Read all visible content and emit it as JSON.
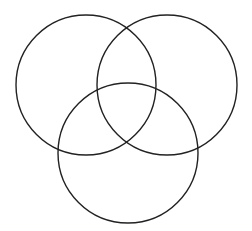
{
  "diagram": {
    "type": "venn",
    "set_count": 3,
    "background": "#ffffff",
    "stroke_color": "#222222",
    "stroke_width": 1.4,
    "circles": [
      {
        "id": "left",
        "cx": 86,
        "cy": 85,
        "r": 70
      },
      {
        "id": "right",
        "cx": 167,
        "cy": 85,
        "r": 70
      },
      {
        "id": "bottom",
        "cx": 128,
        "cy": 153,
        "r": 70
      }
    ],
    "labels": []
  }
}
